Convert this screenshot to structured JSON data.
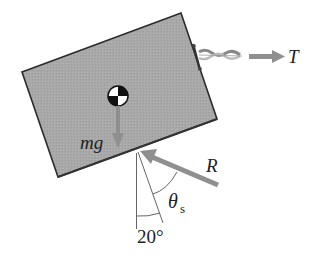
{
  "diagram": {
    "labels": {
      "tension": "T",
      "weight": "mg",
      "reaction": "R",
      "theta": "θ",
      "theta_sub": "s",
      "angle": "20°"
    },
    "colors": {
      "box_fill": "#a9a9a9",
      "box_edge": "#2a2a2a",
      "arrow": "#8f8f8f",
      "line": "#555555"
    }
  }
}
